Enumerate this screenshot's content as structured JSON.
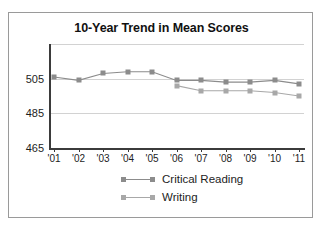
{
  "chart_data": {
    "type": "line",
    "title": "10-Year Trend in Mean Scores",
    "xlabel": "",
    "ylabel": "",
    "categories": [
      "'01",
      "'02",
      "'03",
      "'04",
      "'05",
      "'06",
      "'07",
      "'08",
      "'09",
      "'10",
      "'11"
    ],
    "ylim": [
      465,
      525
    ],
    "yticks": [
      465,
      485,
      505
    ],
    "ygridlines": [
      465,
      485,
      505,
      525
    ],
    "grid": true,
    "legend_position": "bottom",
    "series": [
      {
        "name": "Critical Reading",
        "color": "#8c8c8c",
        "marker": "square",
        "values": [
          506,
          504,
          508,
          509,
          509,
          504,
          504,
          503,
          503,
          504,
          502
        ]
      },
      {
        "name": "Writing",
        "color": "#a8a8a8",
        "marker": "square",
        "values": [
          null,
          null,
          null,
          null,
          null,
          501,
          498,
          498,
          498,
          497,
          495
        ]
      }
    ]
  },
  "legend": {
    "items": [
      {
        "label": "Critical Reading"
      },
      {
        "label": "Writing"
      }
    ]
  },
  "colors": {
    "critical_reading": "#8c8c8c",
    "writing": "#a8a8a8",
    "axis": "#3b3b3b",
    "grid": "#d2d2d2",
    "border": "#9a9a9a",
    "text": "#1d1d1d"
  }
}
